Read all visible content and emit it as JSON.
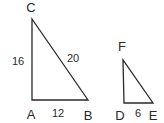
{
  "diagram": {
    "type": "similar-right-triangles",
    "triangles": [
      {
        "name": "ABC",
        "vertices": {
          "A": {
            "label": "A",
            "x": 32,
            "y": 100,
            "lx": 31,
            "ly": 119
          },
          "B": {
            "label": "B",
            "x": 88,
            "y": 100,
            "lx": 88,
            "ly": 120
          },
          "C": {
            "label": "C",
            "x": 32,
            "y": 19,
            "lx": 31,
            "ly": 12
          }
        },
        "sides": {
          "AC": {
            "label": "16",
            "lx": 18,
            "ly": 65
          },
          "CB": {
            "label": "20",
            "lx": 73,
            "ly": 62
          },
          "AB": {
            "label": "12",
            "lx": 58,
            "ly": 117
          }
        }
      },
      {
        "name": "DEF",
        "vertices": {
          "D": {
            "label": "D",
            "x": 124,
            "y": 103,
            "lx": 120,
            "ly": 120
          },
          "E": {
            "label": "E",
            "x": 153,
            "y": 103,
            "lx": 153,
            "ly": 120
          },
          "F": {
            "label": "F",
            "x": 123,
            "y": 60,
            "lx": 122,
            "ly": 51
          }
        },
        "sides": {
          "DE": {
            "label": "6",
            "lx": 138,
            "ly": 117
          }
        }
      }
    ]
  }
}
